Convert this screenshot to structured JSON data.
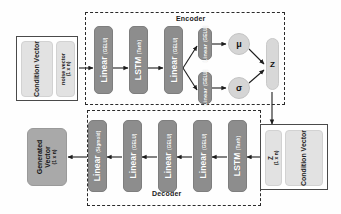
{
  "diagram": {
    "colors": {
      "layer_block": "#8d8d8d",
      "panel_light": "#e2e2e2",
      "generated_block": "#a9a9a9",
      "latent_pill": "#d8d8d8",
      "outline": "#4a4a4a",
      "dashed_border": "#2a2a2a",
      "background": "#fefefe"
    },
    "groups": {
      "encoder_label": "Encoder",
      "decoder_label": "Decoder"
    },
    "input_block": {
      "condition_label": "Condition Vector",
      "noise_label": "noise vector",
      "noise_dim": "(1 x n)"
    },
    "encoder_layers": [
      {
        "name": "Linear",
        "activation": "(GELU)"
      },
      {
        "name": "LSTM",
        "activation": "(Tanh)"
      },
      {
        "name": "Linear",
        "activation": "(GELU)"
      }
    ],
    "head_layers": [
      {
        "name": "Linear",
        "activation": "(GELU)",
        "output": "μ"
      },
      {
        "name": "Linear",
        "activation": "(GELU)",
        "output": "σ"
      }
    ],
    "mu_label": "μ",
    "sigma_label": "σ",
    "latent": {
      "z_label": "Z",
      "z_dim_label": "Z",
      "z_dim": "(1 x n)"
    },
    "decoder_condition_block": {
      "condition_label": "Condition Vector"
    },
    "decoder_layers": [
      {
        "name": "LSTM",
        "activation": "(Tanh)"
      },
      {
        "name": "Linear",
        "activation": "(GELU)"
      },
      {
        "name": "Linear",
        "activation": "(GELU)"
      },
      {
        "name": "Linear",
        "activation": "(GELU)"
      },
      {
        "name": "Linear",
        "activation": "(Sigmoid)"
      }
    ],
    "output_block": {
      "label_line1": "Generated",
      "label_line2": "Vector",
      "dim": "(1 x n)"
    }
  }
}
